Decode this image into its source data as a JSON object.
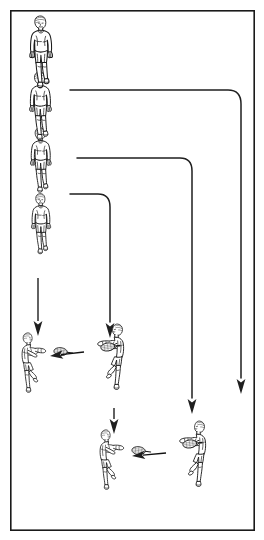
{
  "figure": {
    "title": "Badminton drill movement diagram",
    "caption": "",
    "background_color": "#ffffff",
    "ink_color": "#1a1a1a",
    "border": {
      "color": "#1a1a1a",
      "x": 10,
      "y": 10,
      "width": 245,
      "height": 521
    }
  },
  "diagram": {
    "type": "drill-diagram",
    "sport": "badminton",
    "players": [
      {
        "id": "runner-1",
        "name": "running-player-top",
        "pose": "running-forward",
        "x": 48,
        "y": 15,
        "scale": 1.0,
        "facing": "front"
      },
      {
        "id": "runner-2",
        "name": "running-player-second",
        "pose": "running-forward",
        "x": 48,
        "y": 73,
        "scale": 0.95,
        "facing": "front"
      },
      {
        "id": "runner-3",
        "name": "running-player-third",
        "pose": "running-forward",
        "x": 48,
        "y": 128,
        "scale": 0.9,
        "facing": "front"
      },
      {
        "id": "runner-4",
        "name": "running-player-fourth",
        "pose": "running-forward",
        "x": 46,
        "y": 192,
        "scale": 0.85,
        "facing": "front"
      },
      {
        "id": "hitter-left-upper",
        "name": "rally-player-left-upper",
        "pose": "forehand-stroke",
        "x": 24,
        "y": 336,
        "scale": 0.82,
        "facing": "right"
      },
      {
        "id": "hitter-right-upper",
        "name": "rally-player-right-upper",
        "pose": "forehand-stroke",
        "x": 100,
        "y": 328,
        "scale": 0.9,
        "facing": "left"
      },
      {
        "id": "hitter-left-lower",
        "name": "rally-player-left-lower",
        "pose": "forehand-stroke",
        "x": 102,
        "y": 432,
        "scale": 0.82,
        "facing": "right"
      },
      {
        "id": "hitter-right-lower",
        "name": "rally-player-right-lower",
        "pose": "forehand-stroke",
        "x": 182,
        "y": 425,
        "scale": 0.9,
        "facing": "left"
      }
    ],
    "paths": [
      {
        "id": "path-outer",
        "name": "movement-path-outer",
        "description": "long rounded path to far right column",
        "d": "M 70 90 L 228 90 Q 241 90 241 104 L 241 378",
        "arrow_at": [
          241,
          392
        ]
      },
      {
        "id": "path-middle",
        "name": "movement-path-middle",
        "description": "medium rounded path to middle right column",
        "d": "M 77 158 L 180 158 Q 192 158 192 171 L 192 398",
        "arrow_at": [
          192,
          412
        ]
      },
      {
        "id": "path-inner",
        "name": "movement-path-inner",
        "description": "short rounded path down to left rally pair",
        "d": "M 70 194 L 98 194 Q 110 194 110 207 L 110 322",
        "arrow_at": [
          110,
          336
        ]
      }
    ],
    "arrows": [
      {
        "id": "arrow-left-down",
        "name": "arrow-down-left-column",
        "from": [
          38,
          278
        ],
        "to": [
          38,
          336
        ]
      },
      {
        "id": "arrow-mid-pair-down",
        "name": "arrow-down-between-rally-pairs",
        "from": [
          114,
          408
        ],
        "to": [
          114,
          434
        ]
      }
    ],
    "shuttle_flights": [
      {
        "id": "shuttle-upper",
        "name": "shuttle-flight-upper-pair",
        "from": [
          84,
          352
        ],
        "to": [
          50,
          356
        ],
        "direction": "right-to-left"
      },
      {
        "id": "shuttle-lower",
        "name": "shuttle-flight-lower-pair",
        "from": [
          166,
          453
        ],
        "to": [
          132,
          456
        ],
        "direction": "right-to-left"
      }
    ]
  }
}
